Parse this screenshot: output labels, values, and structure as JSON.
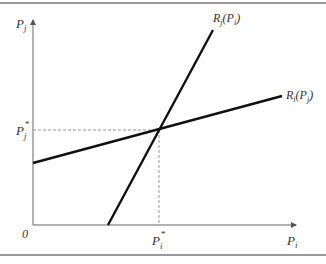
{
  "diagram": {
    "axes": {
      "y_label": {
        "main": "P",
        "sub": "j"
      },
      "x_label": {
        "main": "P",
        "sub": "i"
      },
      "origin_label": "0"
    },
    "equilibrium": {
      "y_tick": {
        "main": "P",
        "sub": "j",
        "sup": "*"
      },
      "x_tick": {
        "main": "P",
        "sub": "i",
        "sup": "*"
      }
    },
    "curves": [
      {
        "id": "Rj",
        "label_main": "R",
        "label_sub": "j",
        "label_arg_main": "P",
        "label_arg_sub": "i",
        "description": "steep upward line"
      },
      {
        "id": "Ri",
        "label_main": "R",
        "label_sub": "i",
        "label_arg_main": "P",
        "label_arg_sub": "j",
        "description": "shallow upward line"
      }
    ],
    "colors": {
      "frame": "#9a9a9a",
      "axis": "#555555",
      "curve": "#111111",
      "dashed": "#999999",
      "text": "#333333"
    }
  }
}
